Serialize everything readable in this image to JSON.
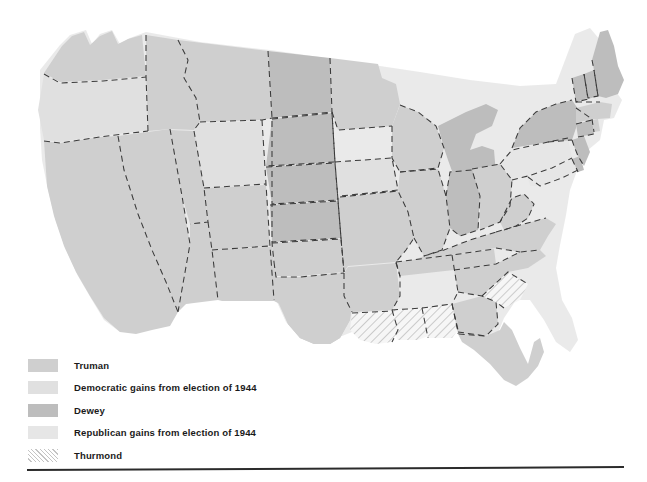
{
  "figure": {
    "kind": "choropleth-map",
    "background_color": "#ffffff"
  },
  "legend": {
    "items": [
      {
        "label": "Truman",
        "swatch": "truman-swatch",
        "color": "#cfcfcf",
        "pattern": "solid"
      },
      {
        "label": "Democratic gains from election of 1944",
        "swatch": "dem-gains-swatch",
        "color": "#e0e0e0",
        "pattern": "solid"
      },
      {
        "label": "Dewey",
        "swatch": "dewey-swatch",
        "color": "#bdbdbd",
        "pattern": "solid"
      },
      {
        "label": "Republican gains from  election of 1944",
        "swatch": "rep-gains-swatch",
        "color": "#e6e6e6",
        "pattern": "solid"
      },
      {
        "label": "Thurmond",
        "swatch": "thurmond-swatch",
        "color": "#f2f2f2",
        "pattern": "diagonal-hatch"
      }
    ]
  },
  "map": {
    "border_style": "dashed",
    "border_color": "#3a3a3a",
    "outline_color": "#cccccc",
    "categories": {
      "truman": "#cfcfcf",
      "dem_gains": "#e0e0e0",
      "dewey": "#bdbdbd",
      "rep_gains": "#e6e6e6",
      "thurmond": "#f2f2f2"
    },
    "states": [
      {
        "code": "WA",
        "name": "Washington",
        "category": "truman"
      },
      {
        "code": "OR",
        "name": "Oregon",
        "category": "dem_gains"
      },
      {
        "code": "CA",
        "name": "California",
        "category": "truman"
      },
      {
        "code": "NV",
        "name": "Nevada",
        "category": "truman"
      },
      {
        "code": "ID",
        "name": "Idaho",
        "category": "truman"
      },
      {
        "code": "MT",
        "name": "Montana",
        "category": "truman"
      },
      {
        "code": "WY",
        "name": "Wyoming",
        "category": "dem_gains"
      },
      {
        "code": "UT",
        "name": "Utah",
        "category": "truman"
      },
      {
        "code": "AZ",
        "name": "Arizona",
        "category": "truman"
      },
      {
        "code": "NM",
        "name": "New Mexico",
        "category": "truman"
      },
      {
        "code": "CO",
        "name": "Colorado",
        "category": "truman"
      },
      {
        "code": "ND",
        "name": "North Dakota",
        "category": "dewey"
      },
      {
        "code": "SD",
        "name": "South Dakota",
        "category": "dewey"
      },
      {
        "code": "NE",
        "name": "Nebraska",
        "category": "dewey"
      },
      {
        "code": "KS",
        "name": "Kansas",
        "category": "dewey"
      },
      {
        "code": "OK",
        "name": "Oklahoma",
        "category": "truman"
      },
      {
        "code": "TX",
        "name": "Texas",
        "category": "truman"
      },
      {
        "code": "MN",
        "name": "Minnesota",
        "category": "truman"
      },
      {
        "code": "IA",
        "name": "Iowa",
        "category": "dem_gains"
      },
      {
        "code": "MO",
        "name": "Missouri",
        "category": "truman"
      },
      {
        "code": "AR",
        "name": "Arkansas",
        "category": "truman"
      },
      {
        "code": "LA",
        "name": "Louisiana",
        "category": "thurmond"
      },
      {
        "code": "MS",
        "name": "Mississippi",
        "category": "thurmond"
      },
      {
        "code": "AL",
        "name": "Alabama",
        "category": "thurmond"
      },
      {
        "code": "SC",
        "name": "South Carolina",
        "category": "thurmond"
      },
      {
        "code": "GA",
        "name": "Georgia",
        "category": "truman"
      },
      {
        "code": "FL",
        "name": "Florida",
        "category": "truman"
      },
      {
        "code": "TN",
        "name": "Tennessee",
        "category": "truman"
      },
      {
        "code": "KY",
        "name": "Kentucky",
        "category": "truman"
      },
      {
        "code": "NC",
        "name": "North Carolina",
        "category": "truman"
      },
      {
        "code": "VA",
        "name": "Virginia",
        "category": "truman"
      },
      {
        "code": "WV",
        "name": "West Virginia",
        "category": "truman"
      },
      {
        "code": "WI",
        "name": "Wisconsin",
        "category": "truman"
      },
      {
        "code": "IL",
        "name": "Illinois",
        "category": "truman"
      },
      {
        "code": "IN",
        "name": "Indiana",
        "category": "dewey"
      },
      {
        "code": "MI",
        "name": "Michigan",
        "category": "dewey"
      },
      {
        "code": "OH",
        "name": "Ohio",
        "category": "truman"
      },
      {
        "code": "PA",
        "name": "Pennsylvania",
        "category": "rep_gains"
      },
      {
        "code": "NY",
        "name": "New York",
        "category": "dewey"
      },
      {
        "code": "MD",
        "name": "Maryland",
        "category": "rep_gains"
      },
      {
        "code": "DE",
        "name": "Delaware",
        "category": "dewey"
      },
      {
        "code": "NJ",
        "name": "New Jersey",
        "category": "dewey"
      },
      {
        "code": "CT",
        "name": "Connecticut",
        "category": "dewey"
      },
      {
        "code": "RI",
        "name": "Rhode Island",
        "category": "truman"
      },
      {
        "code": "MA",
        "name": "Massachusetts",
        "category": "truman"
      },
      {
        "code": "VT",
        "name": "Vermont",
        "category": "dewey"
      },
      {
        "code": "NH",
        "name": "New Hampshire",
        "category": "dewey"
      },
      {
        "code": "ME",
        "name": "Maine",
        "category": "dewey"
      }
    ]
  }
}
